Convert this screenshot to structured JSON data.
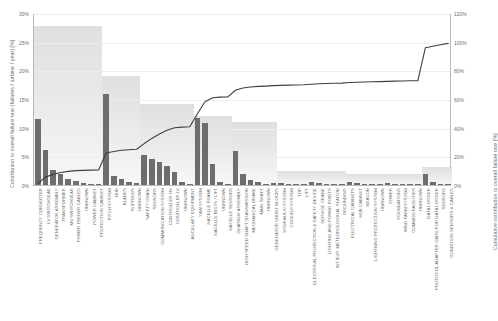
{
  "chart_data": {
    "type": "bar",
    "title": "",
    "subtitle": "",
    "xlabel": "",
    "ylabel": "Contribution to overall failure rate (failures / turbine / year) [%]",
    "y2label": "Cumulative contribution to overall failure rate [%]",
    "ylim": [
      0,
      30
    ],
    "y2lim": [
      0,
      120
    ],
    "yticks": [
      "0%",
      "5%",
      "10%",
      "15%",
      "20%",
      "25%",
      "30%"
    ],
    "ytick_values": [
      0,
      5,
      10,
      15,
      20,
      25,
      30
    ],
    "y2ticks": [
      "0%",
      "20%",
      "40%",
      "60%",
      "80%",
      "100%",
      "120%"
    ],
    "y2tick_values": [
      0,
      20,
      40,
      60,
      80,
      100,
      120
    ],
    "grid": true,
    "legend": "none",
    "bar_color": "#6d6d6d",
    "line_color": "#3f3f3f",
    "band_color": "#e3e3e3",
    "categories": [
      "FREQUENCY CONVERTER",
      "LV SWITCHGEAR",
      "GENERATOR ASSEMBLY",
      "TRANSFORMER",
      "MV SWITCHGEAR",
      "POWER FEEDER CABLES",
      "UNKNOWN",
      "POWER CABINET",
      "PROTECTION CABINET",
      "PITCH SYSTEM",
      "HUB",
      "BLADES",
      "SLIPRINGS",
      "UNKNOWN",
      "SAFETY CHAIN",
      "SENSORS",
      "COMMUNICATION SYSTEM",
      "CONTROLLER HV",
      "CONTROLLER LV",
      "UNKNOWN",
      "ANCILLARY EQUIPMENT",
      "YAW SYSTEM",
      "NACELLE FRAME",
      "NACELLE BELTS / LIFT",
      "UNKNOWN",
      "NACELLE SENSORS",
      "GEARBOX ASSEMBLY",
      "HIGH SPEED SHAFT TRANSMISSION",
      "MECHANICAL BRAKE",
      "MAIN SHAFT",
      "UNKNOWN",
      "GENERATOR SHUNT BLOCKS",
      "HYDRAULIC SYSTEM",
      "COOLING SYSTEM",
      "TOP",
      "LIFT",
      "ELECTRICAL PROTECTION & SAFETY DEVICE",
      "SERVICE CRANE",
      "LIGHTING AND POWER POINTS",
      "INT./EXT. METEOROLOGICAL STATION",
      "GROUNDING",
      "ELECTRICAL CABINETS",
      "HUB CABINET",
      "BEACON",
      "LIGHTNING PROTECTION SYSTEM",
      "UNKNOWN",
      "TOWER",
      "FOUNDATIONS",
      "WIND FARM SYSTEM",
      "COMMON FACILITIES",
      "UNKNOWN",
      "DATA LOGGER",
      "PROTOCOL ADAPTER CARD FOR DATA LOGGER",
      "SENSORS",
      "CONDITION SENSORS & CABLES"
    ],
    "values": [
      11.5,
      6.1,
      2.6,
      1.9,
      1.1,
      0.7,
      0.35,
      0.2,
      0.1,
      15.8,
      1.5,
      1.0,
      0.55,
      0.3,
      5.2,
      4.6,
      4.0,
      3.3,
      2.3,
      0.5,
      0.25,
      11.7,
      10.8,
      3.6,
      0.5,
      0.2,
      5.9,
      2.0,
      0.9,
      0.5,
      0.25,
      0.4,
      0.3,
      0.2,
      0.12,
      0.1,
      0.6,
      0.35,
      0.25,
      0.2,
      0.15,
      0.5,
      0.3,
      0.2,
      0.12,
      0.08,
      0.3,
      0.2,
      0.15,
      0.1,
      0.05,
      1.9,
      0.55,
      0.25,
      0.1
    ],
    "cumulative": [
      1.6,
      6.2,
      8.1,
      9.4,
      10.2,
      10.7,
      10.9,
      11.1,
      11.2,
      23.0,
      24.1,
      24.9,
      25.3,
      25.6,
      29.6,
      33.2,
      36.3,
      38.9,
      40.6,
      41.1,
      41.3,
      50.4,
      58.8,
      61.6,
      62.0,
      62.2,
      66.8,
      68.4,
      69.1,
      69.5,
      69.7,
      70.0,
      70.2,
      70.4,
      70.5,
      70.6,
      71.0,
      71.3,
      71.5,
      71.7,
      71.8,
      72.2,
      72.4,
      72.6,
      72.7,
      72.8,
      73.0,
      73.2,
      73.3,
      73.4,
      73.4,
      96.5,
      97.5,
      98.5,
      99.5
    ],
    "groups": [
      {
        "name": "ELECTRICAL SYSTEM",
        "start": 0,
        "count": 9,
        "height": 27.7
      },
      {
        "name": "ROTOR SYSTEM",
        "start": 9,
        "count": 5,
        "height": 19.1
      },
      {
        "name": "CONTROL SYSTEM",
        "start": 14,
        "count": 7,
        "height": 14.1
      },
      {
        "name": "NACELLE SYSTEM",
        "start": 21,
        "count": 5,
        "height": 12.0
      },
      {
        "name": "DRIVE TRAIN",
        "start": 26,
        "count": 6,
        "height": 11.0
      },
      {
        "name": "AUXILIARY SYSTEM",
        "start": 32,
        "count": 9,
        "height": 2.4
      },
      {
        "name": "STRUCTURE",
        "start": 41,
        "count": 10,
        "height": 1.9
      },
      {
        "name": "MONITORING",
        "start": 51,
        "count": 4,
        "height": 3.2
      }
    ]
  }
}
